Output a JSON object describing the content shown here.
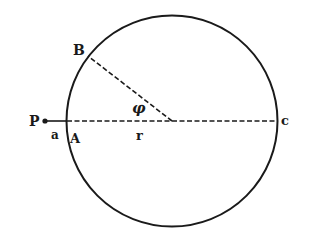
{
  "diagram": {
    "colors": {
      "ink": "#1a1a1a",
      "background": "#ffffff"
    },
    "labels": {
      "P": "P",
      "a": "a",
      "A": "A",
      "B": "B",
      "C": "c",
      "r": "r",
      "phi": "φ"
    },
    "elements": [
      {
        "id": "circle",
        "type": "circle"
      },
      {
        "id": "point-P",
        "type": "point",
        "label": "P"
      },
      {
        "id": "segment-P-A",
        "type": "solid-line",
        "label": "a"
      },
      {
        "id": "line-A-C",
        "type": "dashed-line",
        "passes_through": "center",
        "label": "r"
      },
      {
        "id": "line-center-B",
        "type": "dashed-line"
      },
      {
        "id": "angle-phi",
        "type": "angle",
        "between": [
          "center-B",
          "center-A"
        ],
        "label": "φ"
      }
    ]
  }
}
